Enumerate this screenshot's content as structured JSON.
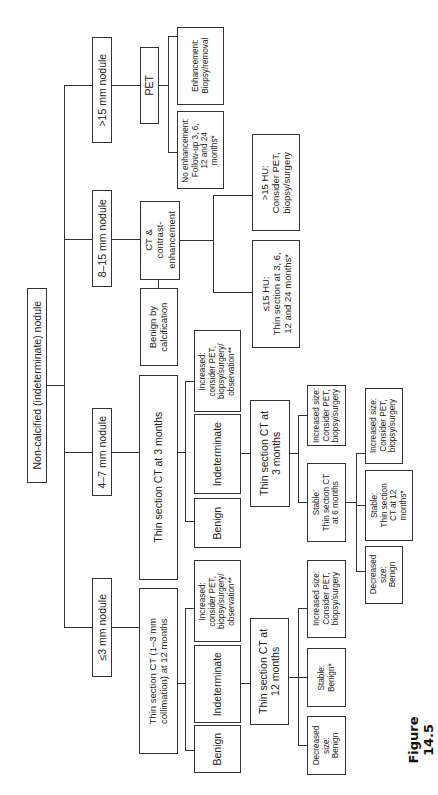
{
  "diagram": {
    "root": "Non-calcified (indeterminate) nodule",
    "branches": {
      "gt15": {
        "label": ">15 mm nodule",
        "pet": "PET",
        "enhancement": "Enhancement:\nBiopsy/removal",
        "no_enhancement": "No enhancement:\nFollow-up 3, 6,\n12 and 24\nmonths*"
      },
      "b8_15": {
        "label": "8–15 mm nodule",
        "study": "Thin-section\nCT &\ncontrast-\nenhancement\nstudy",
        "benign_calc": "Benign by\ncalcification",
        "gt15hu": ">15 HU:\nConsider PET,\nbiopsy/surgery",
        "le15hu": "≤15 HU:\nThin section at 3, 6,\n12 and 24 months*"
      },
      "b4_7": {
        "label": "4–7 mm nodule",
        "ct3": "Thin section CT at 3 months",
        "increased": "Increased:\nconsider PET,\nbiopsy/surgery/\nobservation**",
        "indeterminate": "Indeterminate",
        "benign": "Benign",
        "ct3b": "Thin section CT at\n3 months",
        "increased_size": "Increased size:\nConsider PET,\nbiopsy/surgery",
        "stable6": "Stable:\nThin section CT\nat 6 months",
        "increased_size2": "Increased size:\nConsider PET,\nbiopsy/surgery",
        "stable12": "Stable:\nThin section\nCT at 12\nmonths*",
        "decreased": "Decreased\nsize:\nBenign"
      },
      "le3": {
        "label": "≤3 mm nodule",
        "ct12": "Thin section CT (1–3 mm\ncollimation) at 12 months",
        "increased": "Increased:\nconsider PET,\nbiopsy/surgery/\nobservation**",
        "indeterminate": "Indeterminate",
        "benign": "Benign",
        "ct12b": "Thin section CT at\n12 months",
        "increased_size": "Increased size:\nConsider PET,\nbiopsy/surgery",
        "stable": "Stable:\nBenign*",
        "decreased": "Decreased\nsize:\nBenign"
      }
    },
    "caption": "Figure 14.5"
  }
}
